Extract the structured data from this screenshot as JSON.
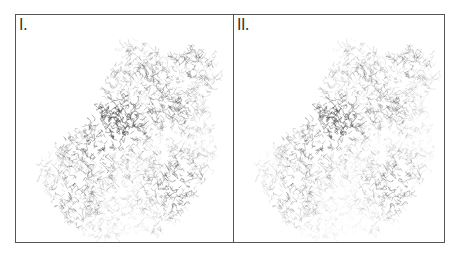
{
  "figure": {
    "panels": [
      {
        "label": "I.",
        "description": "road network map, full density",
        "stroke_color": "#555555",
        "opacity": 0.55
      },
      {
        "label": "II.",
        "description": "road network map, weighted/filtered density",
        "stroke_color": "#444444",
        "opacity": 0.3
      }
    ],
    "colors": {
      "border": "#555555",
      "background": "#ffffff",
      "network": "#4a4a4a"
    }
  }
}
